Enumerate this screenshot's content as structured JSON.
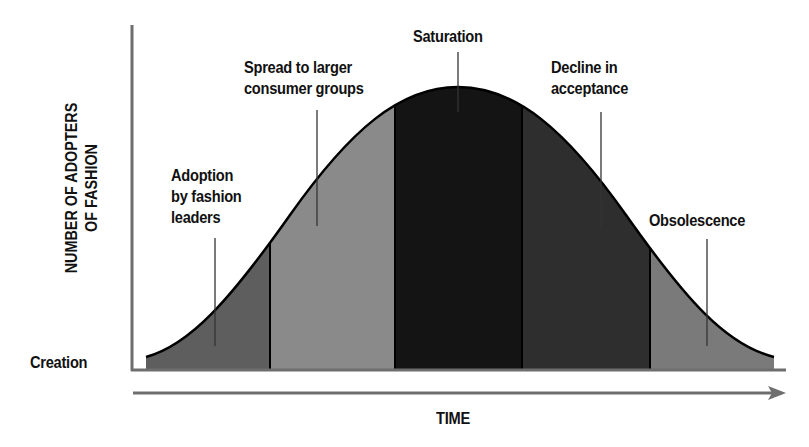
{
  "diagram": {
    "y_axis_label_line1": "NUMBER OF ADOPTERS",
    "y_axis_label_line2": "OF FASHION",
    "x_axis_label": "TIME",
    "origin_label": "Creation",
    "stages": [
      {
        "line1": "Adoption",
        "line2": "by fashion",
        "line3": "leaders",
        "shade": "#5e5e5e"
      },
      {
        "line1": "Spread to larger",
        "line2": "consumer groups",
        "shade": "#8a8a8a"
      },
      {
        "line1": "Saturation",
        "shade": "#141414"
      },
      {
        "line1": "Decline in",
        "line2": "acceptance",
        "shade": "#2e2e2e"
      },
      {
        "line1": "Obsolescence",
        "shade": "#7a7a7a"
      }
    ],
    "colors": {
      "axis": "#6e6e6e",
      "curve_outline": "#000000",
      "text": "#111111"
    }
  }
}
